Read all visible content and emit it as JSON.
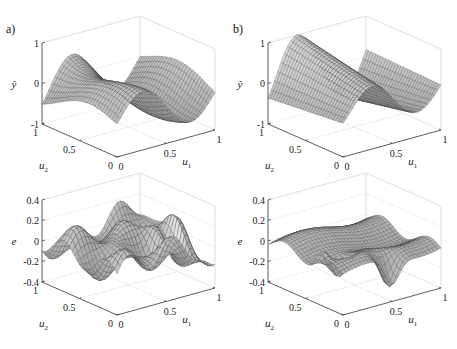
{
  "figure": {
    "panels": [
      {
        "label": "a)"
      },
      {
        "label": "b)"
      }
    ]
  },
  "chart_data": [
    {
      "type": "surface",
      "panel": "a)",
      "row": "top",
      "title": "",
      "xlabel": "u1",
      "ylabel": "u2",
      "zlabel": "ŷ",
      "xticks": [
        "0",
        "0.5",
        "1"
      ],
      "yticks": [
        "0",
        "0.5",
        "1"
      ],
      "zticks": [
        "-1",
        "0",
        "1"
      ],
      "xlim": [
        0,
        1
      ],
      "ylim": [
        0,
        1
      ],
      "zlim": [
        -1,
        1
      ],
      "grid": true,
      "description": "Wavy surface: ridges along u2 rising toward u1≈0.55 and u1≈0.9 (peak ~0.9), trough near -0.8"
    },
    {
      "type": "surface",
      "panel": "b)",
      "row": "top",
      "title": "",
      "xlabel": "u1",
      "ylabel": "u2",
      "zlabel": "ŷ",
      "xticks": [
        "0",
        "0.5",
        "1"
      ],
      "yticks": [
        "0",
        "0.5",
        "1"
      ],
      "zticks": [
        "-1",
        "0",
        "1"
      ],
      "xlim": [
        0,
        1
      ],
      "ylim": [
        0,
        1
      ],
      "zlim": [
        -1,
        1
      ],
      "grid": true,
      "description": "Smooth surface with two parallel ridges along u2 (peaks ~0.9) and trough ~-0.85"
    },
    {
      "type": "surface",
      "panel": "a)",
      "row": "bottom",
      "title": "",
      "xlabel": "u1",
      "ylabel": "u2",
      "zlabel": "e",
      "xticks": [
        "0",
        "0.5",
        "1"
      ],
      "yticks": [
        "0",
        "0.5",
        "1"
      ],
      "zticks": [
        "-0.4",
        "-0.2",
        "0",
        "0.2",
        "0.4"
      ],
      "xlim": [
        0,
        1
      ],
      "ylim": [
        0,
        1
      ],
      "zlim": [
        -0.4,
        0.4
      ],
      "grid": true,
      "description": "Error surface with large oscillations, peaks ~0.35 and minimum ~-0.4 near u1=1,u2=0"
    },
    {
      "type": "surface",
      "panel": "b)",
      "row": "bottom",
      "title": "",
      "xlabel": "u1",
      "ylabel": "u2",
      "zlabel": "e",
      "xticks": [
        "0",
        "0.5",
        "1"
      ],
      "yticks": [
        "0",
        "0.5",
        "1"
      ],
      "zticks": [
        "-0.4",
        "-0.2",
        "0",
        "0.2",
        "0.4"
      ],
      "xlim": [
        0,
        1
      ],
      "ylim": [
        0,
        1
      ],
      "zlim": [
        -0.4,
        0.4
      ],
      "grid": true,
      "description": "Mostly flat error surface near 0 with small ridges (~0.1) and localized dips to ~-0.35"
    }
  ]
}
